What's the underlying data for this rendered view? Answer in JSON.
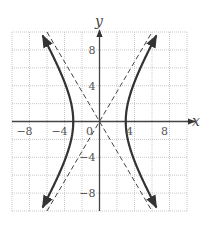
{
  "chart_data": {
    "type": "line",
    "title": "",
    "xlabel": "x",
    "ylabel": "y",
    "xlim": [
      -10,
      10
    ],
    "ylim": [
      -10,
      10
    ],
    "grid": true,
    "grid_step": 2,
    "x_ticks": [
      -8,
      -4,
      0,
      4,
      8
    ],
    "x_tick_labels": [
      "−8",
      "−4",
      "0",
      "4",
      "8"
    ],
    "y_ticks": [
      8,
      4,
      -4,
      -8
    ],
    "y_tick_labels": [
      "8",
      "4",
      "−4",
      "−8"
    ],
    "series": [
      {
        "name": "hyperbola",
        "equation": "x^2/9 - y^2/25 = 1",
        "style": "solid",
        "vertices": [
          [
            -3,
            0
          ],
          [
            3,
            0
          ]
        ],
        "branches": [
          {
            "side": "right",
            "y_range": [
              -10,
              10
            ]
          },
          {
            "side": "left",
            "y_range": [
              -10,
              10
            ]
          }
        ]
      },
      {
        "name": "asymptote-1",
        "equation": "y = 5/3 x",
        "style": "dashed",
        "points": [
          [
            -6,
            -10
          ],
          [
            6,
            10
          ]
        ]
      },
      {
        "name": "asymptote-2",
        "equation": "y = -5/3 x",
        "style": "dashed",
        "points": [
          [
            -6,
            10
          ],
          [
            6,
            -10
          ]
        ]
      }
    ],
    "colors": {
      "curve": "#333333",
      "grid": "#bbbbbb",
      "axis": "#444444"
    }
  }
}
